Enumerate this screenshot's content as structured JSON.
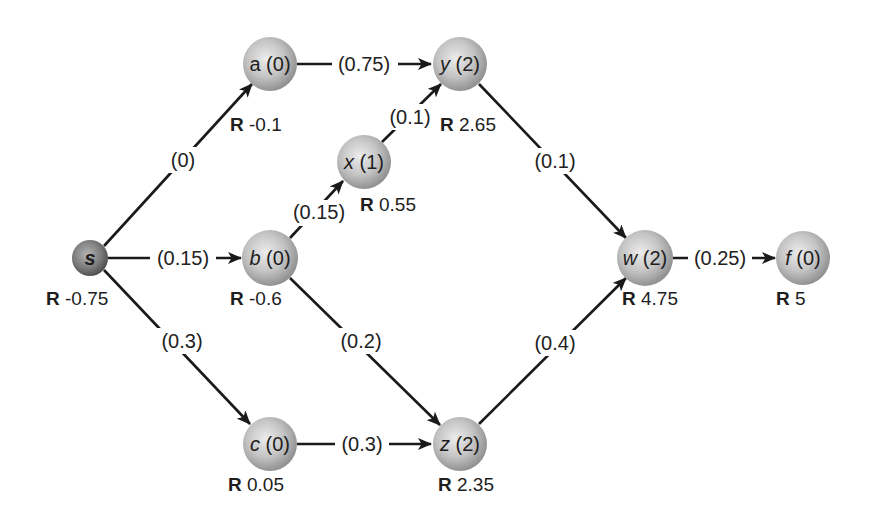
{
  "diagram": {
    "type": "directed-network",
    "colors": {
      "edge": "#1a1a1a",
      "node_light": "#e4e4e4",
      "node_mid": "#bdbdbd",
      "node_dark": "#8f8f8f",
      "source_light": "#b0b0b0",
      "source_dark": "#5a5a5a",
      "text": "#1e1e1e"
    },
    "nodes": [
      {
        "id": "s",
        "name": "s",
        "value": "",
        "r_key": "R",
        "r_value": "-0.75",
        "italic": true,
        "source": true
      },
      {
        "id": "a",
        "name": "a",
        "value": "(0)",
        "r_key": "R",
        "r_value": "-0.1",
        "italic": false
      },
      {
        "id": "b",
        "name": "b",
        "value": "(0)",
        "r_key": "R",
        "r_value": "-0.6",
        "italic": true
      },
      {
        "id": "c",
        "name": "c",
        "value": "(0)",
        "r_key": "R",
        "r_value": "0.05",
        "italic": true
      },
      {
        "id": "x",
        "name": "x",
        "value": "(1)",
        "r_key": "R",
        "r_value": "0.55",
        "italic": true
      },
      {
        "id": "y",
        "name": "y",
        "value": "(2)",
        "r_key": "R",
        "r_value": "2.65",
        "italic": true
      },
      {
        "id": "z",
        "name": "z",
        "value": "(2)",
        "r_key": "R",
        "r_value": "2.35",
        "italic": true
      },
      {
        "id": "w",
        "name": "w",
        "value": "(2)",
        "r_key": "R",
        "r_value": "4.75",
        "italic": true
      },
      {
        "id": "f",
        "name": "f",
        "value": "(0)",
        "r_key": "R",
        "r_value": "5",
        "italic": true
      }
    ],
    "edges": [
      {
        "from": "s",
        "to": "a",
        "label": "(0)"
      },
      {
        "from": "s",
        "to": "b",
        "label": "(0.15)"
      },
      {
        "from": "s",
        "to": "c",
        "label": "(0.3)"
      },
      {
        "from": "a",
        "to": "y",
        "label": "(0.75)"
      },
      {
        "from": "b",
        "to": "x",
        "label": "(0.15)"
      },
      {
        "from": "b",
        "to": "z",
        "label": "(0.2)"
      },
      {
        "from": "x",
        "to": "y",
        "label": "(0.1)"
      },
      {
        "from": "c",
        "to": "z",
        "label": "(0.3)"
      },
      {
        "from": "y",
        "to": "w",
        "label": "(0.1)"
      },
      {
        "from": "z",
        "to": "w",
        "label": "(0.4)"
      },
      {
        "from": "w",
        "to": "f",
        "label": "(0.25)"
      }
    ]
  }
}
